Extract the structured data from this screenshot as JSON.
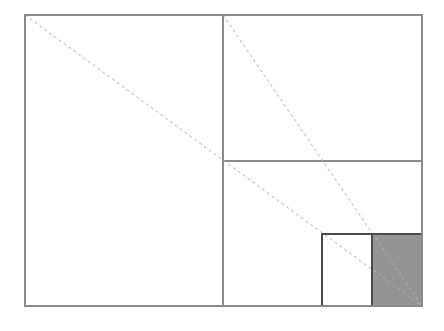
{
  "page": {
    "background_color": "#ffffff",
    "width": 444,
    "height": 331
  },
  "style": {
    "solid_stroke_color": "#8a8a8a",
    "solid_stroke_width": 1.1,
    "dashed_stroke_color": "#b5b5b5",
    "dashed_stroke_width": 1,
    "dash_pattern": "3 3",
    "inner_square_stroke_color": "#4a4a4a",
    "inner_square_stroke_width": 1.4,
    "shaded_fill_color": "#949494",
    "unshaded_fill_color": "#ffffff"
  },
  "chart_data": {
    "type": "diagram",
    "subtitle": "",
    "xlabel": "",
    "ylabel": "",
    "grid": false,
    "legend": "none",
    "annotations": [],
    "coordinate_space": {
      "x_min": 0,
      "y_min": 0,
      "x_max": 444,
      "y_max": 331
    },
    "outer_rectangle": {
      "name": "outer-rectangle",
      "x": 25,
      "y": 15,
      "width": 397,
      "height": 291,
      "fill": "none",
      "stroke": "#8a8a8a"
    },
    "divider_lines": [
      {
        "name": "vertical-divider",
        "x1": 223,
        "y1": 15,
        "x2": 223,
        "y2": 306,
        "stroke": "#8a8a8a",
        "style": "solid"
      },
      {
        "name": "horizontal-divider",
        "x1": 223,
        "y1": 161,
        "x2": 422,
        "y2": 161,
        "stroke": "#8a8a8a",
        "style": "solid"
      }
    ],
    "diagonals": [
      {
        "name": "main-diagonal",
        "x1": 25,
        "y1": 15,
        "x2": 422,
        "y2": 306,
        "stroke": "#b5b5b5",
        "style": "dashed"
      },
      {
        "name": "half-diagonal",
        "x1": 223,
        "y1": 15,
        "x2": 422,
        "y2": 306,
        "stroke": "#b5b5b5",
        "style": "dashed"
      }
    ],
    "squares": [
      {
        "name": "unshaded-square",
        "x": 322,
        "y": 234,
        "width": 50,
        "height": 72,
        "fill": "#ffffff",
        "stroke": "#4a4a4a",
        "shaded": false
      },
      {
        "name": "shaded-square",
        "x": 372,
        "y": 234,
        "width": 50,
        "height": 72,
        "fill": "#949494",
        "stroke": "#4a4a4a",
        "shaded": true
      }
    ]
  }
}
